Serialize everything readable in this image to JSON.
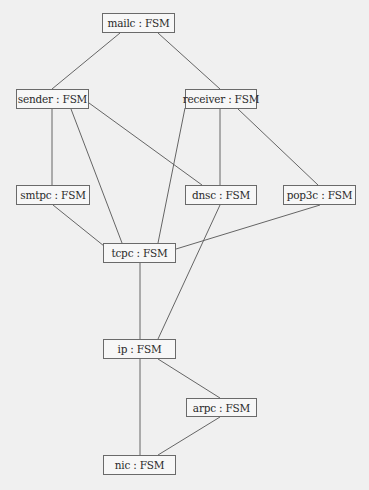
{
  "diagram": {
    "type": "object-dependency-graph",
    "colors": {
      "background": "#f0f0f0",
      "node_fill": "#f7f7f7",
      "node_border": "#6a6a6a",
      "edge": "#555555",
      "text": "#2a2a2a"
    },
    "nodes": [
      {
        "id": "mailc",
        "label": "mailc : FSM",
        "x": 102,
        "y": 13,
        "w": 73,
        "h": 20
      },
      {
        "id": "sender",
        "label": "sender : FSM",
        "x": 16,
        "y": 89,
        "w": 73,
        "h": 20
      },
      {
        "id": "receiver",
        "label": "receiver : FSM",
        "x": 185,
        "y": 89,
        "w": 72,
        "h": 20
      },
      {
        "id": "smtpc",
        "label": "smtpc : FSM",
        "x": 16,
        "y": 185,
        "w": 74,
        "h": 20
      },
      {
        "id": "dnsc",
        "label": "dnsc : FSM",
        "x": 185,
        "y": 185,
        "w": 72,
        "h": 20
      },
      {
        "id": "pop3c",
        "label": "pop3c : FSM",
        "x": 283,
        "y": 185,
        "w": 73,
        "h": 20
      },
      {
        "id": "tcpc",
        "label": "tcpc : FSM",
        "x": 103,
        "y": 243,
        "w": 73,
        "h": 20
      },
      {
        "id": "ip",
        "label": "ip : FSM",
        "x": 103,
        "y": 339,
        "w": 73,
        "h": 20
      },
      {
        "id": "arpc",
        "label": "arpc : FSM",
        "x": 186,
        "y": 398,
        "w": 71,
        "h": 19
      },
      {
        "id": "nic",
        "label": "nic : FSM",
        "x": 103,
        "y": 455,
        "w": 73,
        "h": 20
      }
    ],
    "edges": [
      {
        "from": "mailc",
        "to": "sender",
        "x1": 120,
        "y1": 33,
        "x2": 52,
        "y2": 89
      },
      {
        "from": "mailc",
        "to": "receiver",
        "x1": 158,
        "y1": 33,
        "x2": 220,
        "y2": 89
      },
      {
        "from": "sender",
        "to": "smtpc",
        "x1": 52,
        "y1": 109,
        "x2": 52,
        "y2": 185
      },
      {
        "from": "sender",
        "to": "tcpc",
        "x1": 71,
        "y1": 109,
        "x2": 122,
        "y2": 243
      },
      {
        "from": "sender",
        "to": "dnsc",
        "x1": 89,
        "y1": 103,
        "x2": 202,
        "y2": 185
      },
      {
        "from": "receiver",
        "to": "tcpc",
        "x1": 185,
        "y1": 108,
        "x2": 158,
        "y2": 243
      },
      {
        "from": "receiver",
        "to": "dnsc",
        "x1": 220,
        "y1": 109,
        "x2": 220,
        "y2": 185
      },
      {
        "from": "receiver",
        "to": "pop3c",
        "x1": 238,
        "y1": 109,
        "x2": 318,
        "y2": 185
      },
      {
        "from": "smtpc",
        "to": "tcpc",
        "x1": 53,
        "y1": 205,
        "x2": 104,
        "y2": 246
      },
      {
        "from": "pop3c",
        "to": "tcpc",
        "x1": 320,
        "y1": 205,
        "x2": 176,
        "y2": 249
      },
      {
        "from": "dnsc",
        "to": "ip",
        "x1": 220,
        "y1": 205,
        "x2": 158,
        "y2": 339
      },
      {
        "from": "tcpc",
        "to": "ip",
        "x1": 140,
        "y1": 263,
        "x2": 140,
        "y2": 339
      },
      {
        "from": "ip",
        "to": "arpc",
        "x1": 158,
        "y1": 359,
        "x2": 220,
        "y2": 398
      },
      {
        "from": "ip",
        "to": "nic",
        "x1": 140,
        "y1": 359,
        "x2": 140,
        "y2": 455
      },
      {
        "from": "arpc",
        "to": "nic",
        "x1": 220,
        "y1": 417,
        "x2": 158,
        "y2": 455
      }
    ]
  }
}
